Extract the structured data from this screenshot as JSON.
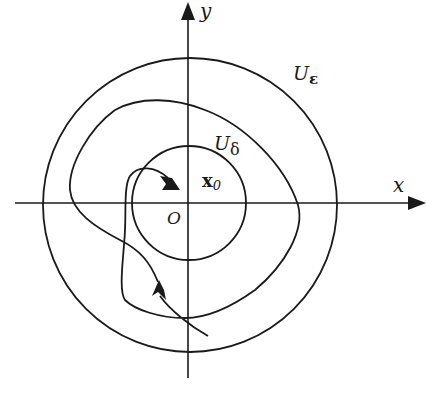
{
  "diagram": {
    "type": "phase-portrait",
    "axes": {
      "x_label": "x",
      "y_label": "y",
      "origin_label": "O"
    },
    "point": {
      "label_main": "x",
      "label_sub": "0"
    },
    "regions": [
      {
        "id": "outer",
        "label_main": "U",
        "label_sub": "ε",
        "radius_px": 147
      },
      {
        "id": "inner",
        "label_main": "U",
        "label_sub": "δ",
        "radius_px": 57
      }
    ],
    "trajectory": {
      "arrows": 2,
      "direction": "enters from lower right, spirals around, ends near x0"
    },
    "colors": {
      "stroke": "#1a1a1a",
      "background": "#ffffff"
    }
  }
}
